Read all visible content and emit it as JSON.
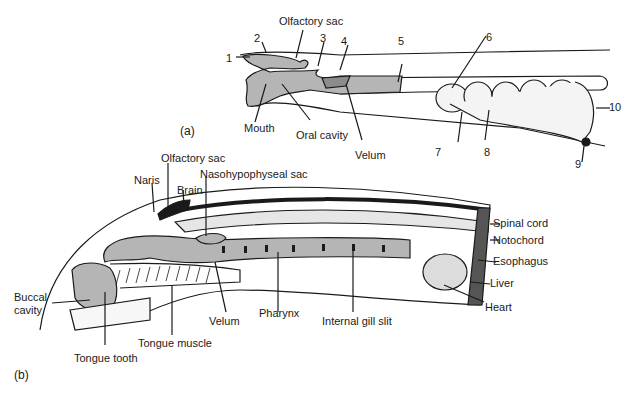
{
  "figure": {
    "panel_a": {
      "tag": "(a)",
      "labels": {
        "olfactory_sac": "Olfactory sac",
        "mouth": "Mouth",
        "oral_cavity": "Oral cavity",
        "velum": "Velum"
      },
      "numbers": [
        "1",
        "2",
        "3",
        "4",
        "5",
        "6",
        "7",
        "8",
        "9",
        "10"
      ]
    },
    "panel_b": {
      "tag": "(b)",
      "labels": {
        "olfactory_sac": "Olfactory sac",
        "naris": "Naris",
        "brain": "Brain",
        "nasohypophyseal_sac": "Nasohypophyseal sac",
        "spinal_cord": "Spinal cord",
        "notochord": "Notochord",
        "esophagus": "Esophagus",
        "liver": "Liver",
        "heart": "Heart",
        "buccal_cavity_1": "Buccal",
        "buccal_cavity_2": "cavity",
        "velum": "Velum",
        "pharynx": "Pharynx",
        "internal_gill_slit": "Internal gill slit",
        "tongue_muscle": "Tongue muscle",
        "tongue_tooth": "Tongue tooth"
      }
    },
    "colors": {
      "tissue_fill": "#b5b5b5",
      "line": "#1a1a1a",
      "background": "#ffffff"
    }
  }
}
